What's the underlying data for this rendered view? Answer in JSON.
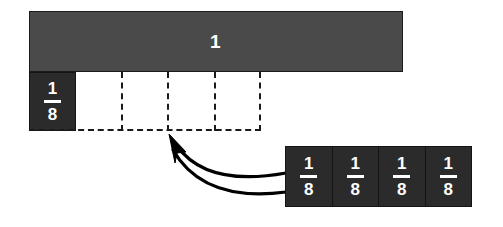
{
  "diagram": {
    "background_color": "#ffffff",
    "whole_bar": {
      "label": "1",
      "fill_color": "#4a4a4a",
      "text_color": "#ffffff"
    },
    "eighth_tile_color": "#2b2b2b",
    "dashed_line_color": "#1a1a1a",
    "left_eighth": {
      "numerator": "1",
      "denominator": "8"
    },
    "partition_region": {
      "segment_count": 4,
      "style": "dashed"
    },
    "arrow": {
      "name": "double-curved-arrow",
      "color": "#000000",
      "direction": "from-right-strip-to-dashed-region"
    },
    "eighths_strip": [
      {
        "numerator": "1",
        "denominator": "8"
      },
      {
        "numerator": "1",
        "denominator": "8"
      },
      {
        "numerator": "1",
        "denominator": "8"
      },
      {
        "numerator": "1",
        "denominator": "8"
      }
    ]
  }
}
